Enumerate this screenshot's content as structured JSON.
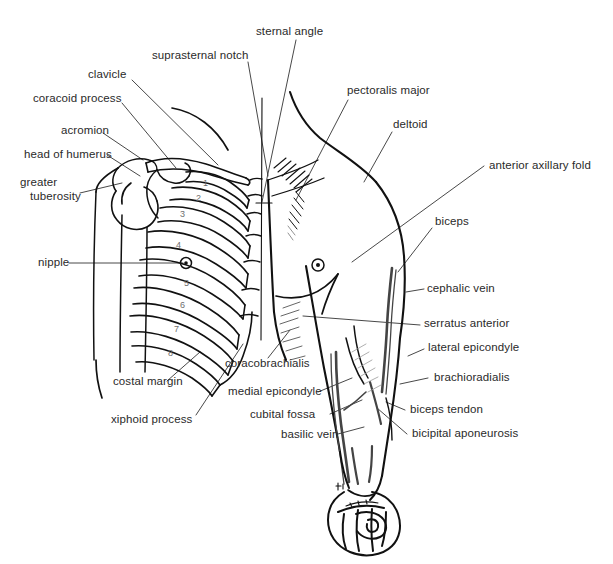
{
  "figure": {
    "caption": "",
    "background_color": "#ffffff",
    "ink_color": "#111111",
    "label_color": "#2a2a2a",
    "rib_number_color": "#6e6e6e",
    "view": "anterior"
  },
  "labels": {
    "sternal_angle": "sternal angle",
    "suprasternal_notch": "suprasternal notch",
    "clavicle": "clavicle",
    "coracoid_process": "coracoid process",
    "acromion": "acromion",
    "head_of_humerus": "head of humerus",
    "greater_tuberosity_line1": "greater",
    "greater_tuberosity_line2": "tuberosity",
    "nipple": "nipple",
    "costal_margin": "costal margin",
    "xiphoid_process": "xiphoid process",
    "coracobrachialis": "coracobrachialis",
    "medial_epicondyle": "medial epicondyle",
    "cubital_fossa": "cubital fossa",
    "basilic_vein": "basilic vein",
    "pectoralis_major": "pectoralis major",
    "deltoid": "deltoid",
    "anterior_axillary_fold": "anterior axillary fold",
    "biceps": "biceps",
    "cephalic_vein": "cephalic vein",
    "serratus_anterior": "serratus anterior",
    "lateral_epicondyle": "lateral epicondyle",
    "brachioradialis": "brachioradialis",
    "biceps_tendon": "biceps tendon",
    "bicipital_aponeurosis": "bicipital aponeurosis"
  },
  "rib_numbers": [
    "1",
    "2",
    "3",
    "4",
    "5",
    "6",
    "7",
    "8"
  ],
  "structures": [
    "rib cage",
    "clavicle",
    "scapula",
    "humerus",
    "sternum",
    "torso outline",
    "arm outline",
    "clenched fist",
    "cephalic vein",
    "basilic vein",
    "serratus anterior digitations",
    "pectoralis major hatching"
  ]
}
